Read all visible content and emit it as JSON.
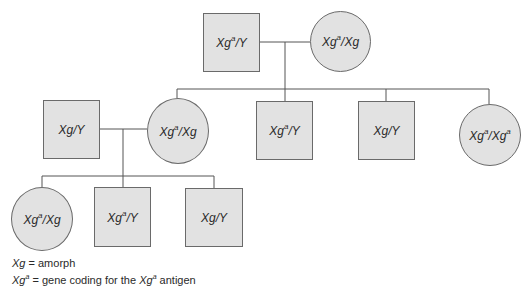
{
  "diagram": {
    "type": "pedigree",
    "colors": {
      "fill": "#e2e2e2",
      "stroke": "#6a6a6a",
      "line": "#555555"
    },
    "generations": [
      {
        "id": "I",
        "members": [
          {
            "id": "I-1",
            "sex": "male",
            "gene1": "Xg",
            "sup1": "a",
            "gene2": "Y",
            "sup2": ""
          },
          {
            "id": "I-2",
            "sex": "female",
            "gene1": "Xg",
            "sup1": "a",
            "gene2": "Xg",
            "sup2": ""
          }
        ]
      },
      {
        "id": "II",
        "members": [
          {
            "id": "II-0",
            "sex": "male",
            "gene1": "Xg",
            "sup1": "",
            "gene2": "Y",
            "sup2": "",
            "note": "married in"
          },
          {
            "id": "II-1",
            "sex": "female",
            "gene1": "Xg",
            "sup1": "a",
            "gene2": "Xg",
            "sup2": ""
          },
          {
            "id": "II-2",
            "sex": "male",
            "gene1": "Xg",
            "sup1": "a",
            "gene2": "Y",
            "sup2": ""
          },
          {
            "id": "II-3",
            "sex": "male",
            "gene1": "Xg",
            "sup1": "",
            "gene2": "Y",
            "sup2": ""
          },
          {
            "id": "II-4",
            "sex": "female",
            "gene1": "Xg",
            "sup1": "a",
            "gene2": "Xg",
            "sup2": "a"
          }
        ]
      },
      {
        "id": "III",
        "members": [
          {
            "id": "III-1",
            "sex": "female",
            "gene1": "Xg",
            "sup1": "a",
            "gene2": "Xg",
            "sup2": ""
          },
          {
            "id": "III-2",
            "sex": "male",
            "gene1": "Xg",
            "sup1": "a",
            "gene2": "Y",
            "sup2": ""
          },
          {
            "id": "III-3",
            "sex": "male",
            "gene1": "Xg",
            "sup1": "",
            "gene2": "Y",
            "sup2": ""
          }
        ]
      }
    ]
  },
  "legend": {
    "line1": {
      "symbol": "Xg",
      "text": " = amorph"
    },
    "line2": {
      "symbol": "Xg",
      "sup": "a",
      "text": " = gene coding for the ",
      "symbol2": "Xg",
      "sup2": "a",
      "text2": " antigen"
    }
  }
}
